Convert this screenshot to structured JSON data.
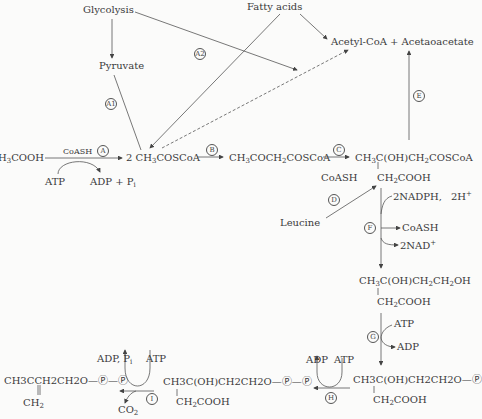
{
  "nodes": {
    "glycolysis": "Glycolysis",
    "fatty_acids": "Fatty acids",
    "pyruvate": "Pyruvate",
    "acetyl_coa_acetoacetate": "Acetyl-CoA + Acetaoacetate",
    "acetate": "H3COOH",
    "acetyl_scoa": "2 CH3COSCoA",
    "acetoacetyl_scoa": "CH3COCH2COSCoA",
    "hmg_scoa_top": "CH3C(OH)CH2COSCoA",
    "hmg_scoa_bottom": "CH2COOH",
    "leucine": "Leucine",
    "mevalonate_top": "CH3C(OH)CH2CH2OH",
    "mevalonate_bottom": "CH2COOH",
    "mevalonate_p_top": "CH3C(OH)CH2CH2O—Ⓟ",
    "mevalonate_p_bottom": "CH2COOH",
    "mevalonate_pp_top": "CH3C(OH)CH2CH2O—Ⓟ—Ⓟ",
    "mevalonate_pp_bottom": "CH2COOH",
    "isopentenyl_pp_top": "CH3CCH2CH2O—Ⓟ—Ⓟ",
    "isopentenyl_pp_bottom": "CH2"
  },
  "cofactors": {
    "coash_a": "CoASH",
    "atp_a": "ATP",
    "adp_pi_a": "ADP + Pi",
    "coash_c": "CoASH",
    "nadph": "2NADPH,",
    "h_plus": "2H+",
    "coash_f": "CoASH",
    "nad": "2NAD+",
    "atp_g": "ATP",
    "adp_g": "ADP",
    "adp_h": "ADP",
    "atp_h": "ATP",
    "adp_pi_i": "ADP, Pi",
    "atp_i": "ATP",
    "co2_i": "CO2"
  },
  "step_labels": {
    "A": "A",
    "A1": "A1",
    "A2": "A2",
    "B": "B",
    "C": "C",
    "D": "D",
    "E": "E",
    "F": "F",
    "G": "G",
    "H": "H",
    "I": "I"
  }
}
